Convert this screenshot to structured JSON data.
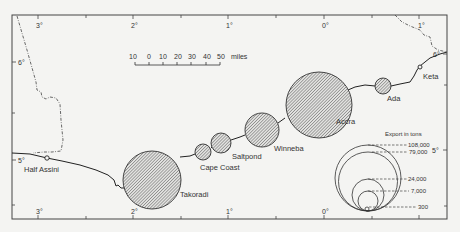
{
  "map": {
    "title": "Ghana coastal ports — export tonnage",
    "background": "#f4f4f2",
    "ink": "#333333",
    "hatch_color": "#555555",
    "longitude_ticks": [
      {
        "label": "3°",
        "x": 38
      },
      {
        "label": "2°",
        "x": 133
      },
      {
        "label": "1°",
        "x": 228
      },
      {
        "label": "0°",
        "x": 324
      },
      {
        "label": "1°",
        "x": 419
      }
    ],
    "latitude_ticks_left": [
      {
        "label": "6°",
        "y": 62
      },
      {
        "label": "5°",
        "y": 160
      }
    ],
    "latitude_ticks_right": [
      {
        "label": "6°",
        "y": 54
      },
      {
        "label": "5°",
        "y": 150
      }
    ],
    "scale_bar": {
      "labels": [
        "10",
        "0",
        "10",
        "20",
        "30",
        "40",
        "50"
      ],
      "unit": "miles"
    },
    "ports": [
      {
        "name": "Half Assini",
        "type": "marker"
      },
      {
        "name": "Takoradi",
        "type": "circle"
      },
      {
        "name": "Cape Coast",
        "type": "circle"
      },
      {
        "name": "Saltpond",
        "type": "circle"
      },
      {
        "name": "Winneba",
        "type": "circle"
      },
      {
        "name": "Accra",
        "type": "circle"
      },
      {
        "name": "Ada",
        "type": "circle"
      },
      {
        "name": "Keta",
        "type": "marker"
      }
    ],
    "legend": {
      "title": "Export in tons",
      "values": [
        "108,000",
        "79,000",
        "24,000",
        "7,000",
        "300"
      ]
    }
  }
}
